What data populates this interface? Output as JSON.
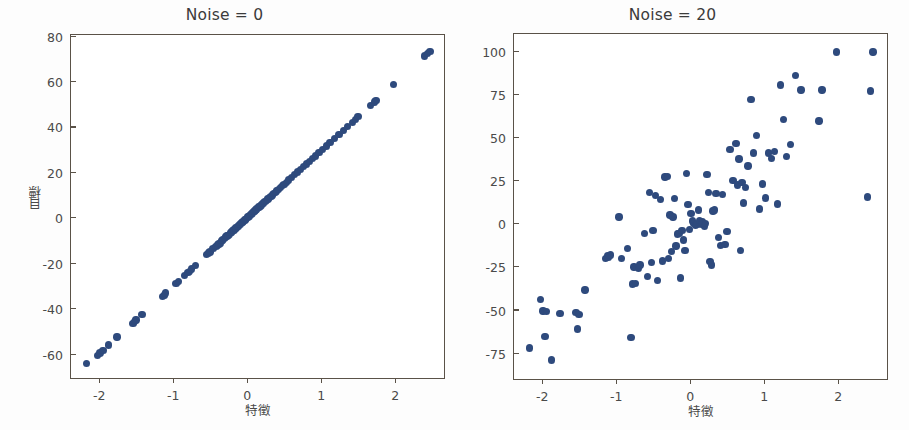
{
  "figure": {
    "background": "#ffffff",
    "marker_color": "#2e4a7d",
    "axis_color": "#5a5248"
  },
  "chart_data": [
    {
      "type": "scatter",
      "title": "Noise = 0",
      "xlabel": "特徵",
      "ylabel": "目標",
      "grid": false,
      "legend": null,
      "xlim": [
        -2.38,
        2.66
      ],
      "ylim": [
        -70.5,
        80.5
      ],
      "xticks": [
        -2,
        -1,
        0,
        1,
        2
      ],
      "yticks": [
        -60,
        -40,
        -20,
        0,
        20,
        40,
        60,
        80
      ],
      "xticklabels": [
        "-2",
        "-1",
        "0",
        "1",
        "2"
      ],
      "yticklabels": [
        "-60",
        "-40",
        "-20",
        "0",
        "20",
        "40",
        "60",
        "80"
      ],
      "x": [
        -2.17,
        -2.02,
        -1.99,
        -1.95,
        -1.87,
        -1.76,
        -1.54,
        -1.52,
        -1.5,
        -1.42,
        -1.14,
        -1.12,
        -1.1,
        -0.96,
        -0.93,
        -0.85,
        -0.8,
        -0.78,
        -0.75,
        -0.7,
        -0.55,
        -0.52,
        -0.5,
        -0.46,
        -0.42,
        -0.4,
        -0.38,
        -0.36,
        -0.34,
        -0.33,
        -0.31,
        -0.29,
        -0.27,
        -0.26,
        -0.24,
        -0.22,
        -0.21,
        -0.19,
        -0.18,
        -0.16,
        -0.15,
        -0.13,
        -0.12,
        -0.1,
        -0.09,
        -0.07,
        -0.06,
        -0.05,
        -0.03,
        -0.02,
        -0.01,
        0.01,
        0.02,
        0.03,
        0.05,
        0.06,
        0.07,
        0.09,
        0.1,
        0.11,
        0.12,
        0.13,
        0.15,
        0.16,
        0.18,
        0.19,
        0.21,
        0.22,
        0.24,
        0.26,
        0.28,
        0.3,
        0.32,
        0.34,
        0.36,
        0.38,
        0.4,
        0.42,
        0.45,
        0.48,
        0.5,
        0.53,
        0.56,
        0.6,
        0.64,
        0.68,
        0.72,
        0.76,
        0.8,
        0.84,
        0.88,
        0.92,
        0.97,
        1.02,
        1.07,
        1.12,
        1.18,
        1.24,
        1.3,
        1.36,
        1.42,
        1.46,
        1.5,
        1.67,
        1.72,
        1.74,
        1.98,
        2.4,
        2.44,
        2.47
      ],
      "y": [
        -64.0,
        -60.5,
        -59.5,
        -58.5,
        -56.0,
        -52.5,
        -46.5,
        -45.5,
        -45.0,
        -42.5,
        -34.5,
        -34.0,
        -33.0,
        -29.0,
        -28.0,
        -25.5,
        -24.0,
        -23.5,
        -22.5,
        -21.0,
        -16.0,
        -15.5,
        -15.0,
        -13.5,
        -12.5,
        -12.0,
        -11.5,
        -11.0,
        -10.0,
        -9.8,
        -9.2,
        -8.5,
        -8.0,
        -7.7,
        -7.2,
        -6.5,
        -6.2,
        -5.6,
        -5.3,
        -4.8,
        -4.5,
        -3.9,
        -3.6,
        -3.0,
        -2.7,
        -2.1,
        -1.8,
        -1.5,
        -0.9,
        -0.6,
        -0.3,
        0.3,
        0.6,
        0.9,
        1.5,
        1.8,
        2.1,
        2.7,
        3.0,
        3.3,
        3.6,
        3.9,
        4.5,
        4.8,
        5.3,
        5.6,
        6.2,
        6.5,
        7.2,
        7.7,
        8.3,
        8.9,
        9.5,
        10.1,
        10.7,
        11.3,
        11.9,
        12.5,
        13.4,
        14.2,
        14.8,
        15.7,
        16.6,
        17.8,
        19.0,
        20.2,
        21.3,
        22.5,
        23.7,
        24.9,
        26.1,
        27.3,
        28.8,
        30.2,
        31.7,
        33.2,
        35.0,
        36.8,
        38.5,
        40.3,
        42.1,
        43.3,
        44.5,
        49.5,
        51.0,
        51.6,
        58.7,
        71.2,
        72.3,
        73.2
      ]
    },
    {
      "type": "scatter",
      "title": "Noise = 20",
      "xlabel": "特徵",
      "ylabel": "目標",
      "grid": false,
      "legend": null,
      "xlim": [
        -2.38,
        2.66
      ],
      "ylim": [
        -90,
        110
      ],
      "xticks": [
        -2,
        -1,
        0,
        1,
        2
      ],
      "yticks": [
        -75,
        -50,
        -25,
        0,
        25,
        50,
        75,
        100
      ],
      "xticklabels": [
        "-2",
        "-1",
        "0",
        "1",
        "2"
      ],
      "yticklabels": [
        "-75",
        "-50",
        "-25",
        "0",
        "25",
        "50",
        "75",
        "100"
      ],
      "x": [
        -2.17,
        -2.02,
        -1.99,
        -1.96,
        -1.94,
        -1.87,
        -1.76,
        -1.54,
        -1.52,
        -1.5,
        -1.42,
        -1.14,
        -1.12,
        -1.1,
        -1.08,
        -0.96,
        -0.93,
        -0.85,
        -0.8,
        -0.78,
        -0.76,
        -0.74,
        -0.7,
        -0.68,
        -0.62,
        -0.58,
        -0.55,
        -0.52,
        -0.5,
        -0.47,
        -0.44,
        -0.4,
        -0.37,
        -0.34,
        -0.31,
        -0.29,
        -0.27,
        -0.25,
        -0.23,
        -0.21,
        -0.19,
        -0.17,
        -0.15,
        -0.13,
        -0.11,
        -0.09,
        -0.07,
        -0.05,
        -0.03,
        -0.01,
        0.01,
        0.03,
        0.05,
        0.07,
        0.09,
        0.11,
        0.13,
        0.15,
        0.17,
        0.19,
        0.21,
        0.23,
        0.25,
        0.27,
        0.29,
        0.31,
        0.33,
        0.35,
        0.38,
        0.41,
        0.44,
        0.47,
        0.5,
        0.54,
        0.58,
        0.62,
        0.64,
        0.66,
        0.68,
        0.7,
        0.72,
        0.75,
        0.78,
        0.82,
        0.86,
        0.9,
        0.94,
        0.98,
        1.02,
        1.06,
        1.1,
        1.14,
        1.18,
        1.22,
        1.26,
        1.3,
        1.36,
        1.42,
        1.5,
        1.74,
        1.78,
        1.98,
        2.4,
        2.44,
        2.47
      ],
      "y": [
        -72.0,
        -44.0,
        -50.5,
        -65.5,
        -51.0,
        -79.0,
        -52.0,
        -51.5,
        -61.0,
        -52.5,
        -38.5,
        -20.0,
        -18.5,
        -19.5,
        -18.0,
        4.0,
        -20.0,
        -14.5,
        -66.0,
        -35.0,
        -25.0,
        -34.5,
        -26.0,
        -24.0,
        -5.5,
        -30.5,
        18.0,
        -22.5,
        -4.0,
        16.5,
        -33.0,
        14.0,
        -21.5,
        27.0,
        27.5,
        -20.0,
        5.0,
        -16.0,
        4.0,
        14.5,
        -13.0,
        -6.0,
        -5.5,
        -31.5,
        -4.0,
        -9.5,
        -15.5,
        29.0,
        11.0,
        -3.5,
        6.0,
        1.5,
        0.0,
        -1.0,
        -0.5,
        8.0,
        2.0,
        -0.5,
        1.0,
        -1.5,
        0.0,
        28.5,
        18.0,
        -22.0,
        -24.0,
        7.5,
        8.0,
        17.5,
        -8.0,
        -12.5,
        17.0,
        -12.0,
        -4.5,
        43.0,
        25.0,
        46.5,
        22.5,
        37.5,
        -15.5,
        24.0,
        12.0,
        21.0,
        33.5,
        72.0,
        41.0,
        51.0,
        8.5,
        23.0,
        15.0,
        41.0,
        38.0,
        42.0,
        11.5,
        80.5,
        60.5,
        39.0,
        46.0,
        86.0,
        77.5,
        59.5,
        77.5,
        99.5,
        15.5,
        77.0,
        99.5
      ]
    }
  ]
}
